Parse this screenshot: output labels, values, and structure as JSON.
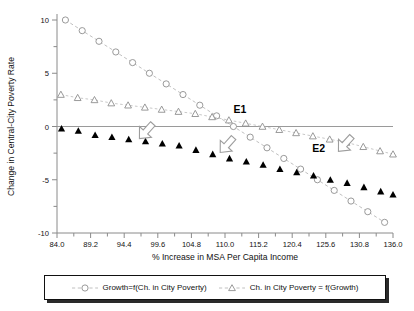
{
  "chart_data": {
    "type": "scatter",
    "title": "",
    "xlabel": "% Increase in MSA Per Capita Income",
    "ylabel": "Change in Central-City Poverty Rate",
    "xlim": [
      84.0,
      136.0
    ],
    "ylim": [
      -10,
      10
    ],
    "xticks": [
      "84.0",
      "89.2",
      "94.4",
      "99.6",
      "104.8",
      "110.0",
      "115.2",
      "120.4",
      "125.6",
      "130.8",
      "136.0"
    ],
    "xtick_values": [
      84.0,
      89.2,
      94.4,
      99.6,
      104.8,
      110.0,
      115.2,
      120.4,
      125.6,
      130.8,
      136.0
    ],
    "yticks": [
      "-10",
      "-5",
      "0",
      "5",
      "10"
    ],
    "ytick_values": [
      -10,
      -5,
      0,
      5,
      10
    ],
    "grid": false,
    "legend_position": "bottom",
    "zero_reference_line": 0,
    "series": [
      {
        "name": "Growth=f(Ch. in City Poverty)",
        "marker": "open-circle",
        "line": "dashed",
        "color": "#9a9a9a",
        "x": [
          85.3,
          87.9,
          90.5,
          93.1,
          95.7,
          98.3,
          100.9,
          103.5,
          106.1,
          108.7,
          111.3,
          113.9,
          116.5,
          119.1,
          121.7,
          124.3,
          126.9,
          129.5,
          132.1,
          134.7
        ],
        "y": [
          10.0,
          9.0,
          8.0,
          7.0,
          6.0,
          5.0,
          4.0,
          3.0,
          2.0,
          1.0,
          0.0,
          -1.0,
          -2.0,
          -3.0,
          -4.0,
          -5.0,
          -6.0,
          -7.0,
          -8.0,
          -9.0
        ]
      },
      {
        "name": "Ch. in City Poverty = f(Growth)",
        "marker": "open-triangle",
        "line": "dashed",
        "color": "#9a9a9a",
        "x": [
          84.6,
          87.2,
          89.8,
          92.4,
          95.0,
          97.6,
          100.2,
          102.8,
          105.4,
          108.0,
          110.6,
          113.2,
          115.8,
          118.4,
          121.0,
          123.6,
          126.2,
          128.8,
          131.4,
          134.0,
          136.0
        ],
        "y": [
          3.0,
          2.7,
          2.5,
          2.2,
          2.0,
          1.8,
          1.6,
          1.4,
          1.2,
          0.9,
          0.6,
          0.3,
          0.0,
          -0.3,
          -0.6,
          -0.9,
          -1.2,
          -1.5,
          -1.9,
          -2.3,
          -2.6
        ]
      },
      {
        "name": "filled-triangle-series",
        "marker": "filled-triangle",
        "line": "none",
        "color": "#000000",
        "x": [
          84.7,
          87.3,
          89.9,
          92.5,
          95.1,
          97.7,
          100.3,
          102.9,
          105.5,
          108.1,
          110.7,
          113.3,
          115.9,
          118.5,
          121.1,
          123.7,
          126.3,
          128.9,
          131.5,
          134.1,
          136.0
        ],
        "y": [
          -0.2,
          -0.4,
          -0.8,
          -1.0,
          -1.2,
          -1.4,
          -1.6,
          -1.8,
          -2.2,
          -2.6,
          -3.0,
          -3.3,
          -3.6,
          -4.0,
          -4.3,
          -4.6,
          -5.0,
          -5.3,
          -5.7,
          -6.1,
          -6.4
        ]
      }
    ],
    "annotations": [
      {
        "name": "E1",
        "label": "E1",
        "x": 112.3,
        "y": 1.3
      },
      {
        "name": "E2",
        "label": "E2",
        "x": 124.5,
        "y": -2.4
      },
      {
        "name": "arrow-1",
        "label": "",
        "x": 98.0,
        "y": -0.3
      },
      {
        "name": "arrow-2",
        "label": "",
        "x": 110.5,
        "y": -1.6
      },
      {
        "name": "arrow-3",
        "label": "",
        "x": 128.8,
        "y": -1.5
      }
    ]
  },
  "legend": {
    "entries": [
      {
        "label": "Growth=f(Ch. in City Poverty)",
        "marker": "open-circle"
      },
      {
        "label": "Ch. in City Poverty = f(Growth)",
        "marker": "open-triangle"
      }
    ]
  },
  "colors": {
    "marker_outline": "#8f8f8f",
    "line": "#b9b9b9",
    "filled_marker": "#000000",
    "axis": "#8a8a8a",
    "text": "#111111",
    "background": "#ffffff"
  }
}
